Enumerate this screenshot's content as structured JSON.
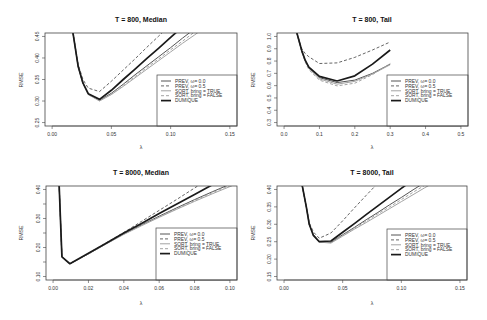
{
  "figure": {
    "panels": [
      {
        "title": "T = 800, Median",
        "xlabel": "λ",
        "ylabel": "RMSE"
      },
      {
        "title": "T = 800, Tail",
        "xlabel": "λ",
        "ylabel": "RMSE"
      },
      {
        "title": "T = 8000, Median",
        "xlabel": "λ",
        "ylabel": "RMSE"
      },
      {
        "title": "T = 8000, Tail",
        "xlabel": "λ",
        "ylabel": "RMSE"
      }
    ]
  },
  "legend": [
    {
      "label": "PREV, ω= 0.0",
      "color": "#555555",
      "dash": "",
      "width": 1.0
    },
    {
      "label": "PREV, ω= 0.5",
      "color": "#666666",
      "dash": "3,2",
      "width": 1.0
    },
    {
      "label": "SORT, bring = TRUE",
      "color": "#a3a3a3",
      "dash": "",
      "width": 1.0
    },
    {
      "label": "SORT, bring = FALSE",
      "color": "#a3a3a3",
      "dash": "3,2",
      "width": 1.0
    },
    {
      "label": "DUMIQUE",
      "color": "#1a1a1a",
      "dash": "",
      "width": 1.7
    }
  ],
  "chart_data": [
    {
      "type": "line",
      "title": "T = 800, Median",
      "xlabel": "λ",
      "ylabel": "RMSE",
      "xlim": [
        0,
        0.15
      ],
      "ylim": [
        0.25,
        0.45
      ],
      "xticks": [
        0,
        0.05,
        0.1,
        0.15
      ],
      "xtick_labels": [
        "0.00",
        "0.05",
        "0.10",
        "0.15"
      ],
      "yticks": [
        0.25,
        0.3,
        0.35,
        0.4,
        0.45
      ],
      "ytick_labels": [
        "0.25",
        "0.30",
        "0.35",
        "0.40",
        "0.45"
      ],
      "grid": false,
      "legend_position": "bottomright",
      "x": [
        0.0175,
        0.022,
        0.026,
        0.0305,
        0.04,
        0.05,
        0.06,
        0.07,
        0.08,
        0.09,
        0.1,
        0.11,
        0.12,
        0.13
      ],
      "series": [
        {
          "name": "PREV, ω= 0.0",
          "values": [
            0.46,
            0.38,
            0.341,
            0.316,
            0.302,
            0.318,
            0.339,
            0.361,
            0.382,
            0.403,
            0.424,
            0.446,
            0.467,
            0.488
          ]
        },
        {
          "name": "PREV, ω= 0.5",
          "values": [
            0.46,
            0.385,
            0.35,
            0.33,
            0.322,
            0.346,
            0.372,
            0.398,
            0.425,
            0.451,
            0.477,
            0.503,
            0.529,
            0.555
          ]
        },
        {
          "name": "SORT, bring = TRUE",
          "values": [
            0.46,
            0.38,
            0.341,
            0.315,
            0.3,
            0.315,
            0.334,
            0.354,
            0.374,
            0.394,
            0.414,
            0.434,
            0.453,
            0.473
          ]
        },
        {
          "name": "SORT, bring = FALSE",
          "values": [
            0.46,
            0.38,
            0.341,
            0.315,
            0.301,
            0.316,
            0.337,
            0.357,
            0.378,
            0.398,
            0.419,
            0.439,
            0.46,
            0.48
          ]
        },
        {
          "name": "DUMIQUE",
          "values": [
            0.46,
            0.38,
            0.342,
            0.317,
            0.304,
            0.325,
            0.35,
            0.374,
            0.399,
            0.423,
            0.448,
            0.472,
            0.497,
            0.521
          ]
        }
      ]
    },
    {
      "type": "line",
      "title": "T = 800, Tail",
      "xlabel": "λ",
      "ylabel": "RMSE",
      "xlim": [
        0,
        0.5
      ],
      "ylim": [
        0.3,
        1.0
      ],
      "xticks": [
        0,
        0.1,
        0.2,
        0.3,
        0.4,
        0.5
      ],
      "xtick_labels": [
        "0.0",
        "0.1",
        "0.2",
        "0.3",
        "0.4",
        "0.5"
      ],
      "yticks": [
        0.3,
        0.4,
        0.5,
        0.6,
        0.7,
        0.8,
        0.9,
        1.0
      ],
      "ytick_labels": [
        "0.3",
        "0.4",
        "0.5",
        "0.6",
        "0.7",
        "0.8",
        "0.9",
        "1.0"
      ],
      "grid": false,
      "legend_position": "bottomright",
      "x": [
        0.036,
        0.05,
        0.06,
        0.07,
        0.1,
        0.15,
        0.2,
        0.25,
        0.3
      ],
      "series": [
        {
          "name": "PREV, ω= 0.0",
          "values": [
            1.03,
            0.88,
            0.8,
            0.745,
            0.665,
            0.625,
            0.645,
            0.7,
            0.775
          ]
        },
        {
          "name": "PREV, ω= 0.5",
          "values": [
            1.03,
            0.9,
            0.86,
            0.835,
            0.78,
            0.785,
            0.83,
            0.89,
            0.955
          ]
        },
        {
          "name": "SORT, bring = TRUE",
          "values": [
            1.03,
            0.88,
            0.8,
            0.74,
            0.655,
            0.612,
            0.635,
            0.695,
            0.77
          ]
        },
        {
          "name": "SORT, bring = FALSE",
          "values": [
            1.03,
            0.875,
            0.79,
            0.73,
            0.645,
            0.598,
            0.62,
            0.69,
            0.78
          ]
        },
        {
          "name": "DUMIQUE",
          "values": [
            1.03,
            0.885,
            0.805,
            0.75,
            0.675,
            0.638,
            0.68,
            0.775,
            0.89
          ]
        }
      ]
    },
    {
      "type": "line",
      "title": "T = 8000, Median",
      "xlabel": "λ",
      "ylabel": "RMSE",
      "xlim": [
        0,
        0.1
      ],
      "ylim": [
        0.1,
        0.4
      ],
      "xticks": [
        0,
        0.02,
        0.04,
        0.06,
        0.08,
        0.1
      ],
      "xtick_labels": [
        "0.00",
        "0.02",
        "0.04",
        "0.06",
        "0.08",
        "0.10"
      ],
      "yticks": [
        0.1,
        0.15,
        0.2,
        0.25,
        0.3,
        0.35,
        0.4
      ],
      "ytick_labels": [
        "0.10",
        "",
        "0.20",
        "",
        "0.30",
        "",
        "0.40"
      ],
      "grid": false,
      "legend_position": "bottomright",
      "x": [
        0.0034,
        0.005,
        0.0095,
        0.02,
        0.03,
        0.04,
        0.05,
        0.06,
        0.07,
        0.08,
        0.09,
        0.1,
        0.11
      ],
      "series": [
        {
          "name": "PREV, ω= 0.0",
          "values": [
            0.42,
            0.168,
            0.144,
            0.178,
            0.213,
            0.247,
            0.278,
            0.308,
            0.337,
            0.365,
            0.392,
            0.418,
            0.444
          ]
        },
        {
          "name": "PREV, ω= 0.5",
          "values": [
            0.42,
            0.168,
            0.144,
            0.18,
            0.216,
            0.252,
            0.29,
            0.328,
            0.366,
            0.405,
            0.444,
            0.483,
            0.522
          ]
        },
        {
          "name": "SORT, bring = TRUE",
          "values": [
            0.42,
            0.168,
            0.144,
            0.178,
            0.212,
            0.245,
            0.275,
            0.304,
            0.332,
            0.359,
            0.385,
            0.41,
            0.435
          ]
        },
        {
          "name": "SORT, bring = FALSE",
          "values": [
            0.42,
            0.168,
            0.144,
            0.178,
            0.213,
            0.246,
            0.277,
            0.306,
            0.334,
            0.362,
            0.389,
            0.414,
            0.44
          ]
        },
        {
          "name": "DUMIQUE",
          "values": [
            0.42,
            0.168,
            0.144,
            0.18,
            0.215,
            0.25,
            0.283,
            0.317,
            0.35,
            0.383,
            0.416,
            0.449,
            0.482
          ]
        }
      ]
    },
    {
      "type": "line",
      "title": "T = 8000, Tail",
      "xlabel": "λ",
      "ylabel": "RMSE",
      "xlim": [
        0,
        0.15
      ],
      "ylim": [
        0.15,
        0.4
      ],
      "xticks": [
        0,
        0.05,
        0.1,
        0.15
      ],
      "xtick_labels": [
        "0.00",
        "0.05",
        "0.10",
        "0.15"
      ],
      "yticks": [
        0.15,
        0.2,
        0.25,
        0.3,
        0.35,
        0.4
      ],
      "ytick_labels": [
        "0.15",
        "0.20",
        "0.25",
        "0.30",
        "0.35",
        "0.40"
      ],
      "grid": false,
      "legend_position": "bottomright",
      "x": [
        0.0153,
        0.019,
        0.0215,
        0.025,
        0.03,
        0.04,
        0.05,
        0.06,
        0.07,
        0.08,
        0.09,
        0.1,
        0.11,
        0.12,
        0.13
      ],
      "series": [
        {
          "name": "PREV, ω= 0.0",
          "values": [
            0.415,
            0.35,
            0.3,
            0.27,
            0.25,
            0.248,
            0.27,
            0.291,
            0.313,
            0.334,
            0.356,
            0.377,
            0.399,
            0.42,
            0.441
          ]
        },
        {
          "name": "PREV, ω= 0.5",
          "values": [
            0.415,
            0.35,
            0.305,
            0.278,
            0.26,
            0.275,
            0.31,
            0.347,
            0.383,
            0.418,
            0.454,
            0.49,
            0.526,
            0.562,
            0.598
          ]
        },
        {
          "name": "SORT, bring = TRUE",
          "values": [
            0.415,
            0.35,
            0.3,
            0.27,
            0.249,
            0.246,
            0.266,
            0.286,
            0.305,
            0.325,
            0.345,
            0.365,
            0.385,
            0.405,
            0.424
          ]
        },
        {
          "name": "SORT, bring = FALSE",
          "values": [
            0.415,
            0.35,
            0.3,
            0.27,
            0.25,
            0.25,
            0.268,
            0.289,
            0.309,
            0.33,
            0.35,
            0.371,
            0.392,
            0.412,
            0.433
          ]
        },
        {
          "name": "DUMIQUE",
          "values": [
            0.415,
            0.35,
            0.3,
            0.268,
            0.25,
            0.252,
            0.277,
            0.302,
            0.328,
            0.353,
            0.378,
            0.403,
            0.428,
            0.453,
            0.478
          ]
        }
      ]
    }
  ]
}
